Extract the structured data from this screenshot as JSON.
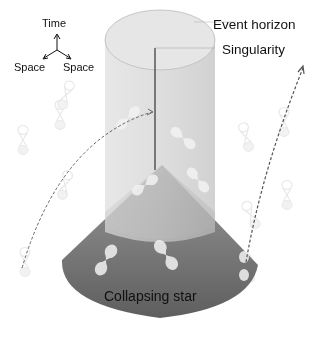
{
  "axes": {
    "time_label": "Time",
    "space_left_label": "Space",
    "space_right_label": "Space"
  },
  "labels": {
    "event_horizon": "Event horizon",
    "singularity": "Singularity",
    "collapsing_star": "Collapsing star"
  },
  "colors": {
    "background": "#ffffff",
    "cylinder": "#d4d4d4",
    "cone_dark": "#6a6a6a",
    "cone_light": "#a8a8a8",
    "light_cone": "#f0f0f0",
    "worldline": "#555555"
  }
}
